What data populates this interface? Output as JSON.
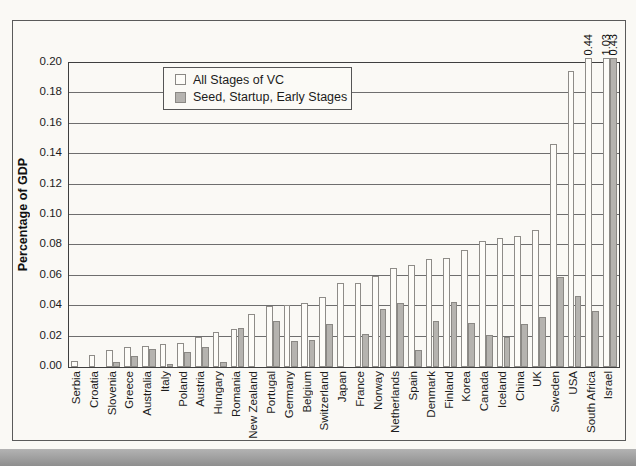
{
  "y_axis": {
    "label": "Percentage of GDP",
    "ticks": [
      "0.00",
      "0.02",
      "0.04",
      "0.06",
      "0.08",
      "0.10",
      "0.12",
      "0.14",
      "0.16",
      "0.18",
      "0.20"
    ]
  },
  "legend": {
    "items": [
      {
        "label": "All Stages of VC",
        "swatch_color": "#fdfcf8"
      },
      {
        "label": "Seed, Startup, Early Stages",
        "swatch_color": "#b5b3af"
      }
    ]
  },
  "chart_data": {
    "type": "bar",
    "ylabel": "Percentage of GDP",
    "ylim": [
      0,
      0.2
    ],
    "ytick_step": 0.02,
    "grid": true,
    "legend_position": "upper left inside plot",
    "categories": [
      "Serbia",
      "Croatia",
      "Slovenia",
      "Greece",
      "Australia",
      "Italy",
      "Poland",
      "Austria",
      "Hungary",
      "Romania",
      "New Zealand",
      "Portugal",
      "Germany",
      "Belgium",
      "Switzerland",
      "Japan",
      "France",
      "Norway",
      "Netherlands",
      "Spain",
      "Denmark",
      "Finland",
      "Korea",
      "Canada",
      "Iceland",
      "China",
      "UK",
      "Sweden",
      "USA",
      "South Africa",
      "Israel"
    ],
    "series": [
      {
        "name": "All Stages of VC",
        "values": [
          0.004,
          0.008,
          0.011,
          0.013,
          0.014,
          0.015,
          0.016,
          0.02,
          0.023,
          0.025,
          0.035,
          0.04,
          0.041,
          0.042,
          0.046,
          0.055,
          0.055,
          0.06,
          0.065,
          0.067,
          0.071,
          0.072,
          0.077,
          0.083,
          0.085,
          0.086,
          0.09,
          0.147,
          0.195,
          0.44,
          1.03
        ]
      },
      {
        "name": "Seed, Startup, Early Stages",
        "values": [
          0,
          0,
          0.003,
          0.007,
          0.012,
          0.002,
          0.01,
          0.013,
          0.003,
          0.026,
          0,
          0.03,
          0.017,
          0.018,
          0.028,
          0,
          0.022,
          0.038,
          0.042,
          0.011,
          0.03,
          0.043,
          0.029,
          0.021,
          0.02,
          0.028,
          0.033,
          0.059,
          0.047,
          0.037,
          0.43
        ]
      }
    ],
    "annotations": [
      {
        "category": "South Africa",
        "series": "All Stages of VC",
        "series_index": 0,
        "text": "0.44"
      },
      {
        "category": "Israel",
        "series": "All Stages of VC",
        "series_index": 0,
        "text": "1.03"
      },
      {
        "category": "Israel",
        "series": "Seed, Startup, Early Stages",
        "series_index": 1,
        "text": "0.43"
      }
    ],
    "colors": {
      "all_stages_fill": "#fdfcf8",
      "seed_fill": "#b5b3af",
      "bar_outline": "#8a8884",
      "gridline": "#6e6e6e",
      "text": "#1c1c1c"
    }
  }
}
